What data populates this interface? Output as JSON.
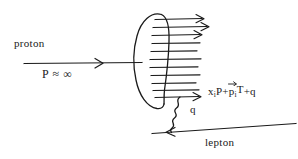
{
  "diagram": {
    "background_color": "#ffffff",
    "stroke_color": "#1a1a1a",
    "labels": {
      "proton": "proton",
      "momentum": "P ≈ ∞",
      "photon": "q",
      "lepton": "lepton",
      "formula_x": "x",
      "formula_sub_i_1": "i",
      "formula_mid": "P+",
      "formula_p": "p",
      "formula_sub_i_2": "i",
      "formula_t": "T",
      "formula_tail": "+q"
    },
    "formula_plain": "x_i P + p⃗_i T + q",
    "icons": {
      "proton_line": "arrow-right-icon",
      "parton_lines": "parton-bundle-icon",
      "photon": "wavy-photon-icon",
      "lepton_line": "arrow-left-icon",
      "blob": "proton-blob-ellipse-icon"
    },
    "geometry": {
      "ellipse_cx": 149,
      "ellipse_cy": 60,
      "ellipse_rx": 15,
      "ellipse_ry": 47,
      "proton_line_y": 63,
      "proton_line_x1": 24,
      "proton_line_x2": 140,
      "proton_arrow_x": 100,
      "parton_line_count": 11,
      "parton_top_y": 19,
      "parton_bottom_y": 97,
      "photon_x": 175,
      "photon_y_top": 97,
      "photon_y_bottom": 129,
      "lepton_x1": 152,
      "lepton_y1": 133,
      "lepton_x2": 295,
      "lepton_y2": 124,
      "lepton_arrow_x": 170
    }
  }
}
